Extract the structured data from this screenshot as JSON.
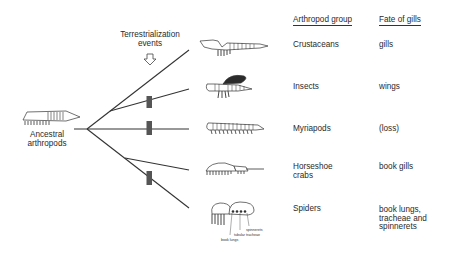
{
  "diagram": {
    "type": "phylogenetic-tree",
    "root_label": "Ancestral arthropods",
    "root_label_lines": [
      "Ancestral",
      "arthropods"
    ],
    "event_label_lines": [
      "Terrestrialization",
      "events"
    ],
    "event_marker": "hollow-down-arrow",
    "colors": {
      "line": "#333333",
      "bar": "#555555",
      "text": "#2a2a2a",
      "wing": "#2b2b2b"
    },
    "headers": {
      "group": "Arthropod group",
      "fate": "Fate of gills"
    },
    "rows": [
      {
        "group_lines": [
          "Crustaceans"
        ],
        "fate_lines": [
          "gills"
        ],
        "terrestrialization": false,
        "icon": "crustacean-icon"
      },
      {
        "group_lines": [
          "Insects"
        ],
        "fate_lines": [
          "wings"
        ],
        "terrestrialization": true,
        "icon": "insect-icon"
      },
      {
        "group_lines": [
          "Myriapods"
        ],
        "fate_lines": [
          "(loss)"
        ],
        "terrestrialization": true,
        "icon": "myriapod-icon"
      },
      {
        "group_lines": [
          "Horseshoe",
          "crabs"
        ],
        "fate_lines": [
          "book gills"
        ],
        "terrestrialization": false,
        "icon": "horseshoe-crab-icon"
      },
      {
        "group_lines": [
          "Spiders"
        ],
        "fate_lines": [
          "book lungs,",
          "tracheae and",
          "spinnerets"
        ],
        "terrestrialization": true,
        "icon": "spider-icon"
      }
    ],
    "spider_annotations": [
      "spinnerets",
      "tubular tracheae",
      "book lungs"
    ]
  }
}
